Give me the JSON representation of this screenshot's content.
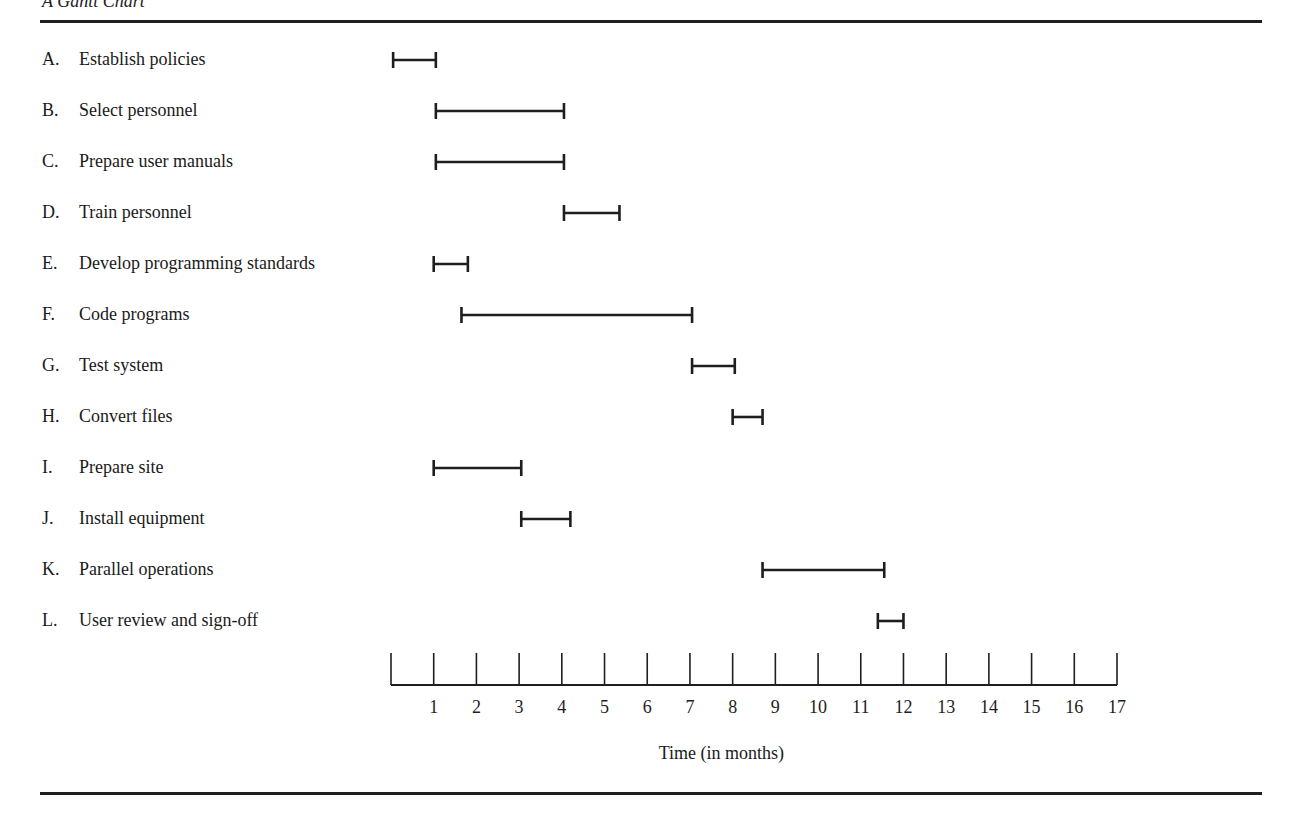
{
  "title": "A Gantt Chart",
  "chart_data": {
    "type": "gantt",
    "title": "A Gantt Chart",
    "xlabel": "Time (in months)",
    "ylabel": "",
    "xlim": [
      0,
      17
    ],
    "x_ticks": [
      1,
      2,
      3,
      4,
      5,
      6,
      7,
      8,
      9,
      10,
      11,
      12,
      13,
      14,
      15,
      16,
      17
    ],
    "grid": false,
    "legend": null,
    "tasks": [
      {
        "letter": "A.",
        "name": "Establish policies",
        "start": 0.05,
        "end": 1.05
      },
      {
        "letter": "B.",
        "name": "Select personnel",
        "start": 1.05,
        "end": 4.05
      },
      {
        "letter": "C.",
        "name": "Prepare user manuals",
        "start": 1.05,
        "end": 4.05
      },
      {
        "letter": "D.",
        "name": "Train personnel",
        "start": 4.05,
        "end": 5.35
      },
      {
        "letter": "E.",
        "name": "Develop programming standards",
        "start": 1.0,
        "end": 1.8
      },
      {
        "letter": "F.",
        "name": "Code programs",
        "start": 1.65,
        "end": 7.05
      },
      {
        "letter": "G.",
        "name": "Test system",
        "start": 7.05,
        "end": 8.05
      },
      {
        "letter": "H.",
        "name": "Convert files",
        "start": 8.0,
        "end": 8.7
      },
      {
        "letter": "I.",
        "name": "Prepare site",
        "start": 1.0,
        "end": 3.05
      },
      {
        "letter": "J.",
        "name": "Install equipment",
        "start": 3.05,
        "end": 4.2
      },
      {
        "letter": "K.",
        "name": "Parallel operations",
        "start": 8.7,
        "end": 11.55
      },
      {
        "letter": "L.",
        "name": "User review and sign-off",
        "start": 11.4,
        "end": 12.0
      }
    ]
  },
  "colors": {
    "ink": "#1e1e1e",
    "background": "#ffffff"
  }
}
